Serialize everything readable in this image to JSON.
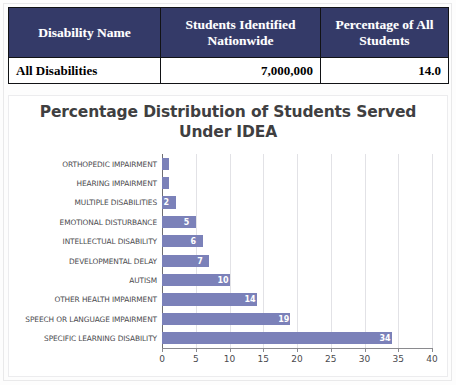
{
  "table": {
    "headers": [
      "Disability Name",
      "Students Identified Nationwide",
      "Percentage of All Students"
    ],
    "header_colors": {
      "background": "#343a68",
      "text": "#ffffff"
    },
    "rows": [
      {
        "name": "All Disabilities",
        "students_identified": "7,000,000",
        "percentage_of_all": "14.0"
      }
    ]
  },
  "chart_data": {
    "type": "bar",
    "orientation": "horizontal",
    "title": "Percentage Distribution of Students Served Under IDEA",
    "title_line1": "Percentage Distribution of Students Served",
    "title_line2": "Under IDEA",
    "xlabel": "",
    "ylabel": "",
    "xlim": [
      0,
      40
    ],
    "xticks": [
      0,
      5,
      10,
      15,
      20,
      25,
      30,
      35,
      40
    ],
    "xtick_labels": [
      "0",
      "5",
      "10",
      "15",
      "20",
      "25",
      "30",
      "35",
      "40"
    ],
    "grid": true,
    "legend": "none",
    "bar_color": "#7b81b9",
    "data_label_color": "#ffffff",
    "categories": [
      "ORTHOPEDIC IMPAIRMENT",
      "HEARING IMPAIRMENT",
      "MULTIPLE DISABILITIES",
      "EMOTIONAL DISTURBANCE",
      "INTELLECTUAL DISABILITY",
      "DEVELOPMENTAL DELAY",
      "AUTISM",
      "OTHER HEALTH IMPAIRMENT",
      "SPEECH OR LANGUAGE IMPAIRMENT",
      "SPECIFIC LEARNING DISABILITY"
    ],
    "values": [
      1,
      1,
      2,
      5,
      6,
      7,
      10,
      14,
      19,
      34
    ],
    "value_labels": [
      "",
      "",
      "2",
      "5",
      "6",
      "7",
      "10",
      "14",
      "19",
      "34"
    ]
  }
}
